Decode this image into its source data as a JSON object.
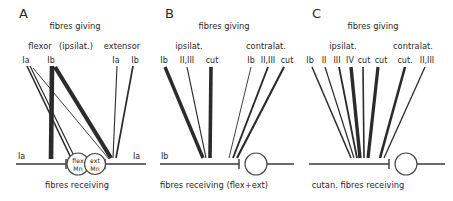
{
  "figure": {
    "panels": [
      {
        "letter": "A",
        "header": "fibres giving",
        "footer": "fibres receiving",
        "groups": [
          {
            "name": "flexor",
            "label": "flexor"
          },
          {
            "name": "ipsilat",
            "label": "(ipsilat.)"
          },
          {
            "name": "extensor",
            "label": "extensor"
          }
        ],
        "fiber_labels": [
          {
            "name": "flexor-ia",
            "label": "Ia"
          },
          {
            "name": "flexor-ib",
            "label": "Ib"
          },
          {
            "name": "extensor-ia",
            "label": "Ia"
          },
          {
            "name": "extensor-ib",
            "label": "Ib"
          }
        ],
        "end_labels": [
          {
            "name": "left-ia",
            "label": "Ia"
          },
          {
            "name": "right-ia",
            "label": "Ia"
          }
        ],
        "motor_neurons": [
          {
            "name": "flex-mn",
            "line1": "flex",
            "line2": "Mn"
          },
          {
            "name": "ext-mn",
            "line1": "ext",
            "line2": "Mn"
          }
        ]
      },
      {
        "letter": "B",
        "header": "fibres giving",
        "footer": "fibres receiving (flex+ext)",
        "groups": [
          {
            "name": "ipsilat",
            "label": "ipsilat."
          },
          {
            "name": "contralat",
            "label": "contralat."
          }
        ],
        "fiber_labels": [
          {
            "name": "ipsi-ib",
            "label": "Ib"
          },
          {
            "name": "ipsi-ii-iii",
            "label": "II,III"
          },
          {
            "name": "ipsi-cut",
            "label": "cut"
          },
          {
            "name": "contra-ib",
            "label": "Ib"
          },
          {
            "name": "contra-ii-iii",
            "label": "II,III"
          },
          {
            "name": "contra-cut",
            "label": "cut"
          }
        ],
        "end_labels": [
          {
            "name": "left-ib",
            "label": "Ib"
          }
        ]
      },
      {
        "letter": "C",
        "header": "fibres giving",
        "footer": "cutan. fibres receiving",
        "groups": [
          {
            "name": "ipsilat",
            "label": "ipsilat."
          },
          {
            "name": "contralat",
            "label": "contralat."
          }
        ],
        "fiber_labels": [
          {
            "name": "ipsi-ib",
            "label": "Ib"
          },
          {
            "name": "ipsi-ii",
            "label": "II"
          },
          {
            "name": "ipsi-iii",
            "label": "III"
          },
          {
            "name": "ipsi-iv",
            "label": "IV"
          },
          {
            "name": "ipsi-cut-1",
            "label": "cut"
          },
          {
            "name": "ipsi-cut-2",
            "label": "cut"
          },
          {
            "name": "contra-cut",
            "label": "cut."
          },
          {
            "name": "contra-ii-iii",
            "label": "II,III"
          }
        ],
        "end_labels": []
      }
    ],
    "colors": {
      "ink": "#2b2b2b",
      "line": "#3a3a3a",
      "background": "#ffffff"
    }
  }
}
